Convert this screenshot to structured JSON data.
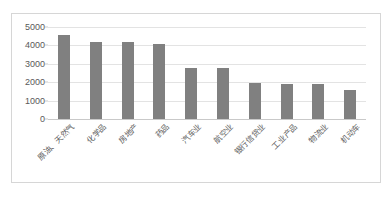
{
  "chart_data": {
    "type": "bar",
    "title": "",
    "subtitle": "",
    "xlabel": "",
    "ylabel": "",
    "ylim": [
      0,
      5000
    ],
    "grid": true,
    "legend": false,
    "y_ticks": [
      "5000",
      "4000",
      "3000",
      "2000",
      "1000",
      "0"
    ],
    "y_tick_values": [
      5000,
      4000,
      3000,
      2000,
      1000,
      0
    ],
    "bar_color": "#808080",
    "gridline_color": "#e3e3e3",
    "border_color": "#d6d6d6",
    "axis_text_color": "#595959",
    "categories": [
      "原油、天然气",
      "化学品",
      "房地产",
      "药品",
      "汽车业",
      "航空业",
      "银行信贷业",
      "工业产品",
      "物流业",
      "机动车"
    ],
    "values": [
      4560,
      4160,
      4160,
      4080,
      2760,
      2760,
      1980,
      1920,
      1920,
      1550
    ]
  }
}
